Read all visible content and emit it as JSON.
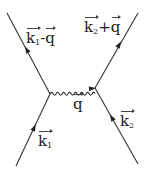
{
  "diagram": {
    "type": "feynman",
    "colors": {
      "line": "#333333",
      "background": "#ffffff"
    },
    "vertices": [
      {
        "id": "v1",
        "x": 50,
        "y": 94
      },
      {
        "id": "v2",
        "x": 95,
        "y": 88
      }
    ],
    "lines": [
      {
        "id": "k1_in",
        "kind": "fermion",
        "from": [
          16,
          166
        ],
        "to": [
          50,
          94
        ],
        "label": "k1"
      },
      {
        "id": "k1_out",
        "kind": "fermion",
        "from": [
          50,
          94
        ],
        "to": [
          7,
          13
        ],
        "label": "k1-q"
      },
      {
        "id": "photon",
        "kind": "photon",
        "from": [
          50,
          94
        ],
        "to": [
          95,
          88
        ],
        "label": "q"
      },
      {
        "id": "k2_in",
        "kind": "fermion",
        "from": [
          138,
          164
        ],
        "to": [
          95,
          88
        ],
        "label": "k2"
      },
      {
        "id": "k2_out",
        "kind": "fermion",
        "from": [
          95,
          88
        ],
        "to": [
          138,
          13
        ],
        "label": "k2+q"
      }
    ],
    "labels": {
      "k1_minus_q": {
        "base1": "k",
        "sub1": "1",
        "op": "-",
        "base2": "q"
      },
      "k2_plus_q": {
        "base1": "k",
        "sub1": "2",
        "op": "+",
        "base2": "q"
      },
      "q": {
        "base": "q"
      },
      "k1": {
        "base": "k",
        "sub": "1"
      },
      "k2": {
        "base": "k",
        "sub": "2"
      }
    }
  }
}
